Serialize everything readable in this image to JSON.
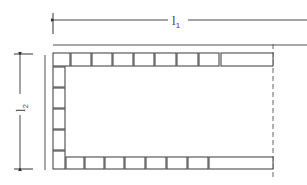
{
  "diagram": {
    "type": "brick-border-plan",
    "dimensions": {
      "horizontal": {
        "label": "l",
        "subscript": "1"
      },
      "vertical": {
        "label": "l",
        "subscript": "2"
      }
    },
    "colors": {
      "brick_stroke": "#4a4a4a",
      "wall_line": "#a8a8a8",
      "dimension_line": "#333333"
    },
    "top_row": {
      "bricks": [
        {
          "x": 53,
          "w": 17
        },
        {
          "x": 71,
          "w": 20
        },
        {
          "x": 92,
          "w": 20
        },
        {
          "x": 113,
          "w": 20
        },
        {
          "x": 134,
          "w": 20
        },
        {
          "x": 155,
          "w": 21
        },
        {
          "x": 177,
          "w": 21
        },
        {
          "x": 199,
          "w": 20
        },
        {
          "x": 221,
          "w": 52
        }
      ],
      "y": 53,
      "h": 13
    },
    "left_column": {
      "bricks": [
        {
          "y": 67,
          "h": 20
        },
        {
          "y": 88,
          "h": 20
        },
        {
          "y": 109,
          "h": 20
        },
        {
          "y": 130,
          "h": 20
        },
        {
          "y": 151,
          "h": 18
        }
      ],
      "x": 53,
      "w": 12
    },
    "bottom_row": {
      "bricks": [
        {
          "x": 66,
          "w": 18
        },
        {
          "x": 85,
          "w": 19
        },
        {
          "x": 105,
          "w": 19
        },
        {
          "x": 125,
          "w": 20
        },
        {
          "x": 146,
          "w": 20
        },
        {
          "x": 167,
          "w": 20
        },
        {
          "x": 188,
          "w": 20
        },
        {
          "x": 209,
          "w": 64
        }
      ],
      "y": 157,
      "h": 12
    }
  }
}
